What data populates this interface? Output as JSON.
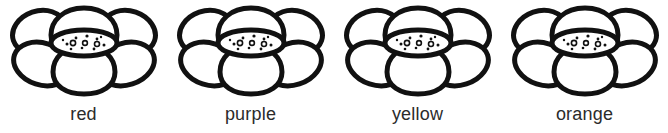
{
  "worksheet": {
    "background_color": "#ffffff",
    "ink_color": "#111111",
    "label_color": "#2b2b2b",
    "items": [
      {
        "label": "red",
        "flower_icon": "flower-icon"
      },
      {
        "label": "purple",
        "flower_icon": "flower-icon"
      },
      {
        "label": "yellow",
        "flower_icon": "flower-icon"
      },
      {
        "label": "orange",
        "flower_icon": "flower-icon"
      }
    ]
  }
}
